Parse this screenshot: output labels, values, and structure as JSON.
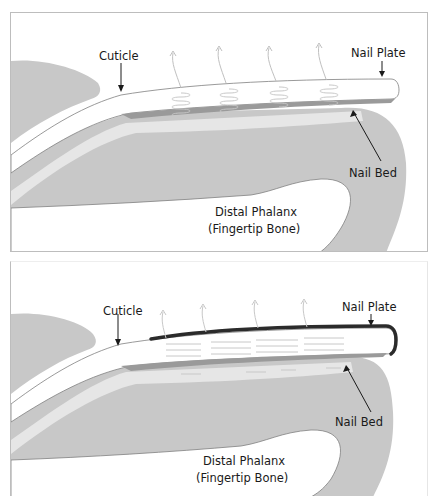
{
  "figure": {
    "panels": [
      {
        "id": "before",
        "labels": {
          "cuticle": "Cuticle",
          "nail_plate": "Nail Plate",
          "nail_bed": "Nail Bed",
          "bone_line1": "Distal Phalanx",
          "bone_line2": "(Fingertip Bone)"
        },
        "nail_plate_coated": false
      },
      {
        "id": "after",
        "labels": {
          "cuticle": "Cuticle",
          "nail_plate": "Nail Plate",
          "nail_bed": "Nail Bed",
          "bone_line1": "Distal Phalanx",
          "bone_line2": "(Fingertip Bone)"
        },
        "nail_plate_coated": true
      }
    ],
    "colors": {
      "tissue": "#c8c8c8",
      "light_tissue": "#e6e6e6",
      "nail_bed": "#9a9a9a",
      "nail_plate": "#ffffff",
      "coating": "#2b2b2b",
      "outline": "#808080",
      "label": "#1a1a1a"
    }
  }
}
